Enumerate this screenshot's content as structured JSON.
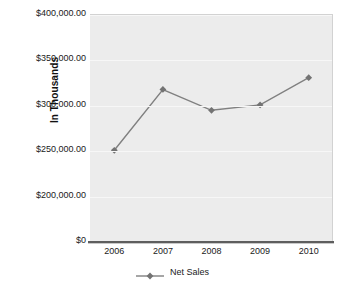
{
  "chart_data": {
    "type": "line",
    "title": "",
    "xlabel": "",
    "ylabel": "In Thousands",
    "categories": [
      "2006",
      "2007",
      "2008",
      "2009",
      "2010"
    ],
    "series": [
      {
        "name": "Net Sales",
        "values": [
          251000,
          318000,
          295000,
          301000,
          331000
        ]
      }
    ],
    "y_tick_labels": [
      "$400,000.00",
      "$350,000.00",
      "$300,000.00",
      "$250,000.00",
      "$200,000.00",
      "$0"
    ],
    "y_tick_values": [
      400000,
      350000,
      300000,
      250000,
      200000,
      0
    ],
    "ylim": [
      150000,
      400000
    ],
    "axis_break": true,
    "grid": true,
    "legend_position": "bottom",
    "colors": {
      "line": "#808080",
      "marker": "#737373",
      "plot_background": "#ececec",
      "gridline": "#f7f7f7",
      "axis": "#5e5e5e",
      "text": "#1a1a1a"
    },
    "marker_shape": "diamond"
  }
}
